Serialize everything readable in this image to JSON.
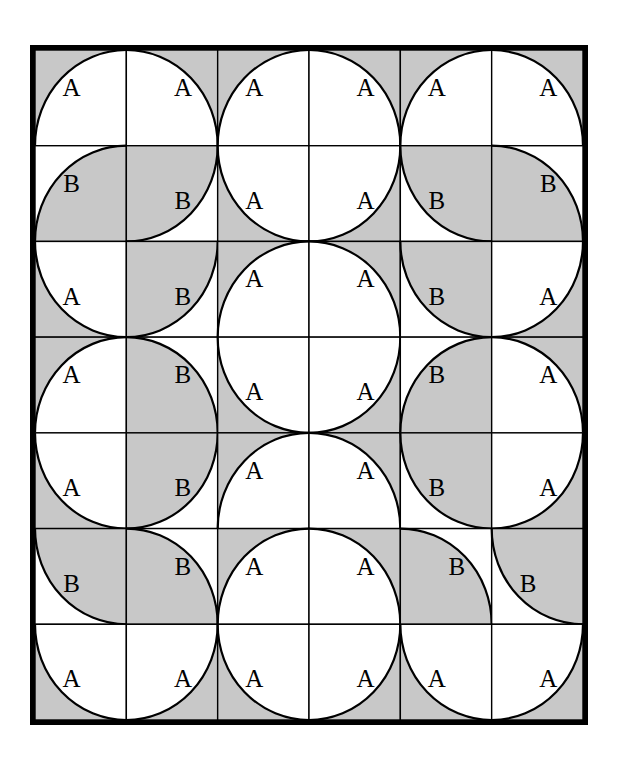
{
  "figure": {
    "grid": {
      "columns": 6,
      "rows": 7
    },
    "colors": {
      "shaded": "#c8c8c8",
      "unshaded": "#ffffff",
      "line": "#000000",
      "border": "#000000"
    },
    "labels": {
      "a": "A",
      "b": "B"
    },
    "border_width_px": 5,
    "cell_size_px": 91.3,
    "tiles": [
      [
        {
          "label": "A",
          "corner": "br",
          "arc_shaded": false
        },
        {
          "label": "A",
          "corner": "bl",
          "arc_shaded": false
        },
        {
          "label": "A",
          "corner": "br",
          "arc_shaded": false
        },
        {
          "label": "A",
          "corner": "bl",
          "arc_shaded": false
        },
        {
          "label": "A",
          "corner": "br",
          "arc_shaded": false
        },
        {
          "label": "A",
          "corner": "bl",
          "arc_shaded": false
        }
      ],
      [
        {
          "label": "B",
          "corner": "br",
          "arc_shaded": true
        },
        {
          "label": "B",
          "corner": "tl",
          "arc_shaded": true
        },
        {
          "label": "A",
          "corner": "tr",
          "arc_shaded": false
        },
        {
          "label": "A",
          "corner": "tl",
          "arc_shaded": false
        },
        {
          "label": "B",
          "corner": "tr",
          "arc_shaded": true
        },
        {
          "label": "B",
          "corner": "bl",
          "arc_shaded": true
        }
      ],
      [
        {
          "label": "A",
          "corner": "tr",
          "arc_shaded": false
        },
        {
          "label": "B",
          "corner": "tl",
          "arc_shaded": true
        },
        {
          "label": "A",
          "corner": "br",
          "arc_shaded": false
        },
        {
          "label": "A",
          "corner": "bl",
          "arc_shaded": false
        },
        {
          "label": "B",
          "corner": "tr",
          "arc_shaded": true
        },
        {
          "label": "A",
          "corner": "tl",
          "arc_shaded": false
        }
      ],
      [
        {
          "label": "A",
          "corner": "br",
          "arc_shaded": false
        },
        {
          "label": "B",
          "corner": "bl",
          "arc_shaded": true
        },
        {
          "label": "A",
          "corner": "tr",
          "arc_shaded": false
        },
        {
          "label": "A",
          "corner": "tl",
          "arc_shaded": false
        },
        {
          "label": "B",
          "corner": "br",
          "arc_shaded": true
        },
        {
          "label": "A",
          "corner": "bl",
          "arc_shaded": false
        }
      ],
      [
        {
          "label": "A",
          "corner": "tr",
          "arc_shaded": false
        },
        {
          "label": "B",
          "corner": "tl",
          "arc_shaded": true
        },
        {
          "label": "A",
          "corner": "br",
          "arc_shaded": false
        },
        {
          "label": "A",
          "corner": "bl",
          "arc_shaded": false
        },
        {
          "label": "B",
          "corner": "tr",
          "arc_shaded": true
        },
        {
          "label": "A",
          "corner": "tl",
          "arc_shaded": false
        }
      ],
      [
        {
          "label": "B",
          "corner": "tr",
          "arc_shaded": true
        },
        {
          "label": "B",
          "corner": "bl",
          "arc_shaded": true
        },
        {
          "label": "A",
          "corner": "br",
          "arc_shaded": false
        },
        {
          "label": "A",
          "corner": "bl",
          "arc_shaded": false
        },
        {
          "label": "B",
          "corner": "bl",
          "arc_shaded": true
        },
        {
          "label": "B",
          "corner": "tr",
          "arc_shaded": true
        }
      ],
      [
        {
          "label": "A",
          "corner": "tr",
          "arc_shaded": false
        },
        {
          "label": "A",
          "corner": "tl",
          "arc_shaded": false
        },
        {
          "label": "A",
          "corner": "tr",
          "arc_shaded": false
        },
        {
          "label": "A",
          "corner": "tl",
          "arc_shaded": false
        },
        {
          "label": "A",
          "corner": "tr",
          "arc_shaded": false
        },
        {
          "label": "A",
          "corner": "tl",
          "arc_shaded": false
        }
      ]
    ]
  }
}
